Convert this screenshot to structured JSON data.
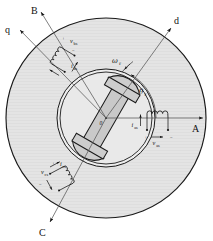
{
  "figure": {
    "type": "machine-cross-section"
  },
  "axes": {
    "phase_a": "A",
    "phase_b": "B",
    "phase_c": "C",
    "direct": "d",
    "quadrature": "q"
  },
  "rotor": {
    "speed_symbol": "ω",
    "speed_subscript": "r",
    "angle_symbol": "θ",
    "angle_subscript": "r",
    "origin_label": "0"
  },
  "windings": {
    "phase_a": {
      "voltage_symbol": "v",
      "voltage_subscript": "as",
      "current_symbol": "i",
      "current_subscript": "as",
      "plus": "+",
      "minus": "−"
    },
    "phase_b": {
      "voltage_symbol": "v",
      "voltage_subscript": "bs",
      "current_symbol": "i",
      "current_subscript": "bs",
      "plus": "+",
      "minus": "−"
    },
    "phase_c": {
      "voltage_symbol": "v",
      "voltage_subscript": "cs",
      "current_symbol": "i",
      "current_subscript": "cs",
      "plus": "+",
      "minus": "−"
    }
  },
  "colors": {
    "stator_fill": "#e2e2e2",
    "rotor_fill": "#c9c9c9",
    "outline": "#1a1a1a",
    "background": "#ffffff",
    "gap_fill": "#ededed"
  }
}
